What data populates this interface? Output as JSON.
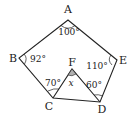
{
  "figure": {
    "type": "pentagon with inner triangle",
    "vertices": {
      "A": {
        "label": "A"
      },
      "B": {
        "label": "B"
      },
      "C": {
        "label": "C"
      },
      "D": {
        "label": "D"
      },
      "E": {
        "label": "E"
      },
      "F": {
        "label": "F"
      }
    },
    "angles": {
      "A": "100°",
      "B": "92°",
      "E": "110°",
      "C": "70°",
      "D": "60°",
      "F": "x"
    },
    "colors": {
      "stroke": "#222222",
      "shaded_angle": "#b0b0b0"
    }
  }
}
